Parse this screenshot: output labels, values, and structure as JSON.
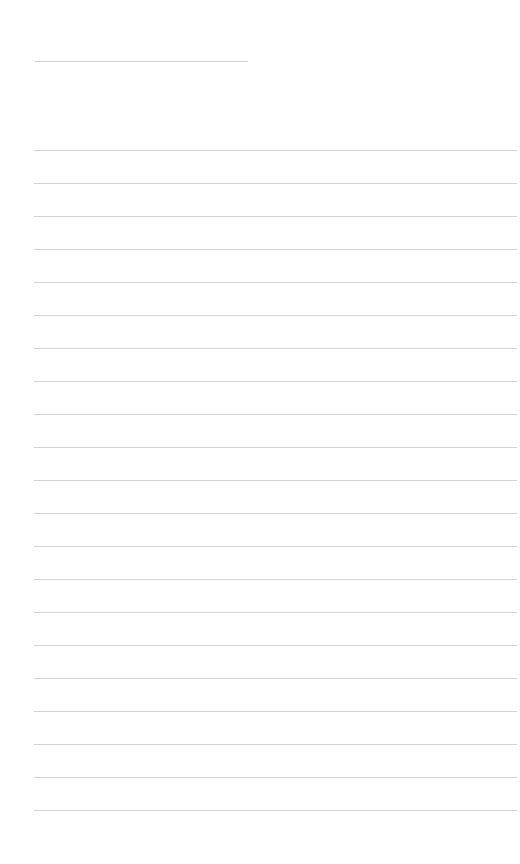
{
  "page": {
    "type": "lined-writing-paper",
    "background_color": "#ffffff",
    "line_color": "#d2d2d2",
    "title_rule": {
      "x": 35,
      "y": 61,
      "width": 213
    },
    "rules": {
      "count": 21,
      "start_y": 150,
      "spacing": 33,
      "x": 34,
      "width": 483
    },
    "page_number": ""
  }
}
